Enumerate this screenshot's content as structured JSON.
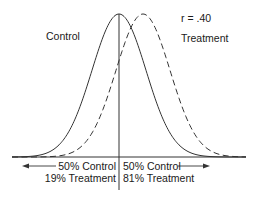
{
  "labels": {
    "control": "Control",
    "treatment": "Treatment",
    "correlation": "r = .40",
    "left_line1": "50% Control",
    "left_line2": "19% Treatment",
    "right_line1": "50% Control",
    "right_line2": "81% Treatment"
  },
  "diagram": {
    "type": "overlapping-normal-distributions",
    "curves": [
      {
        "name": "Control",
        "style": "solid",
        "mean_px": 119,
        "sigma_px": 27
      },
      {
        "name": "Treatment",
        "style": "dashed",
        "mean_px": 143,
        "sigma_px": 27
      }
    ],
    "baseline_y": 157,
    "peak_y": 14,
    "x_range": [
      12,
      246
    ],
    "divider_x": 119,
    "divider_y": [
      14,
      190
    ],
    "stroke_color": "#333333"
  }
}
